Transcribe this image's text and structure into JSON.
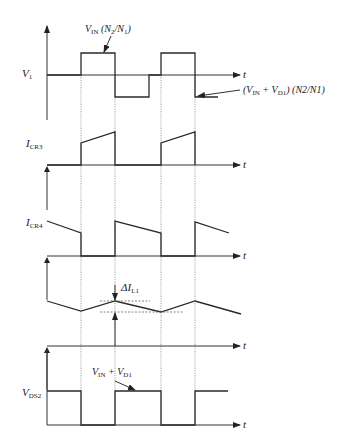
{
  "figure": {
    "axis_label": "t",
    "panels": [
      {
        "id": "v1",
        "label_main": "V",
        "label_sub": "1",
        "baseline_y": 75
      },
      {
        "id": "icr3",
        "label_main": "I",
        "label_sub": "CR3",
        "baseline_y": 165
      },
      {
        "id": "icr4",
        "label_main": "I",
        "label_sub": "CR4",
        "baseline_y": 256
      },
      {
        "id": "il1",
        "label_main": "",
        "label_sub": "",
        "baseline_y": 346
      },
      {
        "id": "vds2",
        "label_main": "V",
        "label_sub": "DS2",
        "baseline_y": 425
      }
    ],
    "annotations": {
      "v1_high": {
        "main": "V",
        "sub": "IN",
        "rest": " (N",
        "sub2": "2",
        "mid": "/N",
        "sub3": "1",
        "end": ")"
      },
      "v1_low": {
        "text_a": "(V",
        "sub_a": "IN",
        "text_b": " + V",
        "sub_b": "D1",
        "text_c": ") (N2/N1)"
      },
      "delta_il1": {
        "main": "ΔI",
        "sub": "L1"
      },
      "vds2_high": {
        "main": "V",
        "sub": "IN",
        "plus": " + V",
        "sub2": "D1"
      }
    },
    "switch_edges_x": [
      81,
      115,
      161,
      195
    ]
  }
}
